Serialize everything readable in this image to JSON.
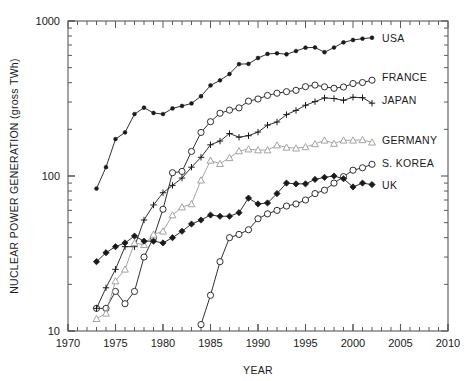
{
  "chart_data": {
    "type": "line",
    "title": "",
    "xlabel": "YEAR",
    "ylabel": "NUCLEAR POWER GENERATION (gross TWh)",
    "xlim": [
      1970,
      2010
    ],
    "ylim": [
      10,
      1000
    ],
    "yscale": "log",
    "grid": false,
    "legend_position": "right",
    "xticks": [
      1970,
      1975,
      1980,
      1985,
      1990,
      1995,
      2000,
      2005,
      2010
    ],
    "xticklabels": [
      "1970",
      "1975",
      "1980",
      "1985",
      "1990",
      "1995",
      "2000",
      "2005",
      "2010"
    ],
    "yticks": [
      10,
      100,
      1000
    ],
    "yticklabels": [
      "10",
      "100",
      "1000"
    ],
    "series": [
      {
        "name": "USA",
        "marker": "filled-circle-small",
        "color": "#1a1a1a",
        "x": [
          1973,
          1974,
          1975,
          1976,
          1977,
          1978,
          1979,
          1980,
          1981,
          1982,
          1983,
          1984,
          1985,
          1986,
          1987,
          1988,
          1989,
          1990,
          1991,
          1992,
          1993,
          1994,
          1995,
          1996,
          1997,
          1998,
          1999,
          2000,
          2001,
          2002
        ],
        "values": [
          83,
          114,
          173,
          191,
          251,
          276,
          255,
          251,
          273,
          283,
          294,
          327,
          384,
          414,
          455,
          527,
          529,
          577,
          613,
          619,
          610,
          640,
          673,
          675,
          629,
          674,
          728,
          754,
          769,
          780
        ]
      },
      {
        "name": "FRANCE",
        "marker": "open-circle",
        "color": "#1a1a1a",
        "x": [
          1973,
          1974,
          1975,
          1976,
          1977,
          1978,
          1979,
          1980,
          1981,
          1982,
          1983,
          1984,
          1985,
          1986,
          1987,
          1988,
          1989,
          1990,
          1991,
          1992,
          1993,
          1994,
          1995,
          1996,
          1997,
          1998,
          1999,
          2000,
          2001,
          2002
        ],
        "values": [
          14,
          14,
          18,
          15,
          18,
          30,
          40,
          61,
          105,
          107,
          144,
          191,
          224,
          254,
          266,
          275,
          304,
          314,
          331,
          342,
          350,
          357,
          377,
          386,
          376,
          368,
          375,
          395,
          401,
          415
        ]
      },
      {
        "name": "JAPAN",
        "marker": "plus",
        "color": "#1a1a1a",
        "x": [
          1973,
          1974,
          1975,
          1976,
          1977,
          1978,
          1979,
          1980,
          1981,
          1982,
          1983,
          1984,
          1985,
          1986,
          1987,
          1988,
          1989,
          1990,
          1991,
          1992,
          1993,
          1994,
          1995,
          1996,
          1997,
          1998,
          1999,
          2000,
          2001,
          2002
        ],
        "values": [
          14,
          19,
          25,
          35,
          35,
          52,
          65,
          78,
          87,
          97,
          114,
          132,
          159,
          168,
          188,
          178,
          182,
          192,
          213,
          223,
          249,
          265,
          286,
          302,
          319,
          316,
          308,
          322,
          320,
          295
        ]
      },
      {
        "name": "GERMANY",
        "marker": "open-triangle",
        "color": "#9a9a9a",
        "x": [
          1973,
          1974,
          1975,
          1976,
          1977,
          1978,
          1979,
          1980,
          1981,
          1982,
          1983,
          1984,
          1985,
          1986,
          1987,
          1988,
          1989,
          1990,
          1991,
          1992,
          1993,
          1994,
          1995,
          1996,
          1997,
          1998,
          1999,
          2000,
          2001,
          2002
        ],
        "values": [
          12,
          13,
          21,
          25,
          37,
          36,
          42,
          44,
          56,
          63,
          66,
          94,
          126,
          120,
          131,
          145,
          149,
          147,
          147,
          158,
          153,
          151,
          154,
          161,
          170,
          162,
          170,
          170,
          171,
          165
        ]
      },
      {
        "name": "S. KOREA",
        "marker": "open-circle",
        "color": "#1a1a1a",
        "x": [
          1984,
          1985,
          1986,
          1987,
          1988,
          1989,
          1990,
          1991,
          1992,
          1993,
          1994,
          1995,
          1996,
          1997,
          1998,
          1999,
          2000,
          2001,
          2002
        ],
        "values": [
          11,
          17,
          28,
          40,
          42,
          45,
          53,
          57,
          60,
          64,
          66,
          70,
          77,
          81,
          90,
          99,
          109,
          113,
          119
        ]
      },
      {
        "name": "UK",
        "marker": "filled-diamond",
        "color": "#1a1a1a",
        "x": [
          1973,
          1974,
          1975,
          1976,
          1977,
          1978,
          1979,
          1980,
          1981,
          1982,
          1983,
          1984,
          1985,
          1986,
          1987,
          1988,
          1989,
          1990,
          1991,
          1992,
          1993,
          1994,
          1995,
          1996,
          1997,
          1998,
          1999,
          2000,
          2001,
          2002
        ],
        "values": [
          28,
          32,
          35,
          37,
          41,
          38,
          38,
          37,
          40,
          44,
          49,
          52,
          56,
          55,
          55,
          58,
          72,
          66,
          67,
          77,
          90,
          89,
          89,
          95,
          98,
          100,
          96,
          85,
          90,
          88
        ]
      }
    ]
  },
  "legend": {
    "entries": [
      {
        "label": "USA"
      },
      {
        "label": "FRANCE"
      },
      {
        "label": "JAPAN"
      },
      {
        "label": "GERMANY"
      },
      {
        "label": "S. KOREA"
      },
      {
        "label": "UK"
      }
    ]
  }
}
